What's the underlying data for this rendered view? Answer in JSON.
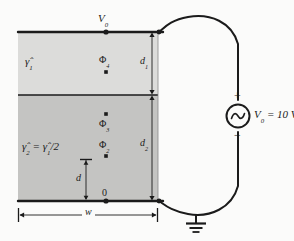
{
  "diagram": {
    "type": "circuit-schematic",
    "colors": {
      "upper_region_fill": "#dcdcda",
      "lower_region_fill": "#c4c4c2",
      "line": "#1b1b1b",
      "background": "#fbfbfa"
    },
    "labels": {
      "top_node": "V",
      "top_node_sub": "0",
      "upper_material": "γ̂",
      "upper_material_sub": "1",
      "lower_material_lhs": "γ̂",
      "lower_material_lhs_sub": "2",
      "lower_material_rhs": "= γ̂",
      "lower_material_rhs_sub": "1",
      "lower_material_tail": "/2",
      "node_phi4": "Φ",
      "node_phi4_sub": "4",
      "node_phi3": "Φ",
      "node_phi3_sub": "3",
      "node_phi2": "Φ",
      "node_phi2_sub": "2",
      "node_zero": "0",
      "dim_d1": "d",
      "dim_d1_sub": "1",
      "dim_d2": "d",
      "dim_d2_sub": "2",
      "dim_d": "d",
      "dim_w": "w",
      "source_plus": "+",
      "source_minus": "−",
      "source_value": "V",
      "source_value_sub": "0",
      "source_value_tail": "= 10 V"
    },
    "elements": {
      "source_symbol": "ac-voltage-source",
      "ground_symbol": "earth-ground",
      "node_markers": 6
    },
    "geometry": {
      "plate_left_x": 18,
      "plate_right_x": 158,
      "top_plate_y": 32,
      "interface_y": 95,
      "bottom_plate_y": 201,
      "node_column_x": 106,
      "d1_dim_x": 152,
      "d2_dim_x": 152,
      "w_dim_y": 215
    }
  }
}
